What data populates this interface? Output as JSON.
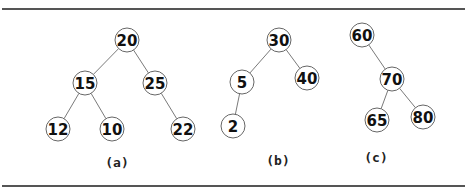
{
  "figure": {
    "rules": {
      "top_y": 9,
      "bottom_y": 186,
      "x1": 2,
      "x2": 465
    },
    "trees": [
      {
        "id": "a",
        "caption": "(a)",
        "caption_pos": [
          117,
          167
        ],
        "nodes": [
          {
            "id": "a20",
            "label": "20",
            "x": 127,
            "y": 40
          },
          {
            "id": "a15",
            "label": "15",
            "x": 85,
            "y": 83
          },
          {
            "id": "a25",
            "label": "25",
            "x": 155,
            "y": 83
          },
          {
            "id": "a12",
            "label": "12",
            "x": 58,
            "y": 129
          },
          {
            "id": "a10",
            "label": "10",
            "x": 112,
            "y": 129
          },
          {
            "id": "a22",
            "label": "22",
            "x": 183,
            "y": 129
          }
        ],
        "edges": [
          [
            "a20",
            "a15"
          ],
          [
            "a20",
            "a25"
          ],
          [
            "a15",
            "a12"
          ],
          [
            "a15",
            "a10"
          ],
          [
            "a25",
            "a22"
          ]
        ]
      },
      {
        "id": "b",
        "caption": "(b)",
        "caption_pos": [
          278,
          165
        ],
        "nodes": [
          {
            "id": "b30",
            "label": "30",
            "x": 279,
            "y": 40
          },
          {
            "id": "b5",
            "label": "5",
            "x": 242,
            "y": 82
          },
          {
            "id": "b40",
            "label": "40",
            "x": 307,
            "y": 78
          },
          {
            "id": "b2",
            "label": "2",
            "x": 233,
            "y": 126
          }
        ],
        "edges": [
          [
            "b30",
            "b5"
          ],
          [
            "b30",
            "b40"
          ],
          [
            "b5",
            "b2"
          ]
        ]
      },
      {
        "id": "c",
        "caption": "(c)",
        "caption_pos": [
          376,
          162
        ],
        "nodes": [
          {
            "id": "c60",
            "label": "60",
            "x": 362,
            "y": 35
          },
          {
            "id": "c70",
            "label": "70",
            "x": 392,
            "y": 79
          },
          {
            "id": "c65",
            "label": "65",
            "x": 377,
            "y": 120
          },
          {
            "id": "c80",
            "label": "80",
            "x": 423,
            "y": 117
          }
        ],
        "edges": [
          [
            "c60",
            "c70"
          ],
          [
            "c70",
            "c65"
          ],
          [
            "c70",
            "c80"
          ]
        ]
      }
    ],
    "node_radius": 12
  }
}
